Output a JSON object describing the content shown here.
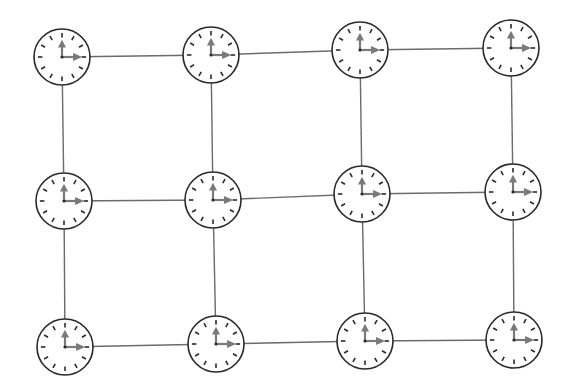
{
  "diagram": {
    "colors": {
      "background": "#ffffff",
      "line": "#6b6b6b",
      "clock_outline": "#2a2a2a",
      "tick": "#2a2a2a",
      "hand": "#7a7a7a"
    },
    "clock_radius": 28,
    "time_shown": "3:00",
    "rows": 3,
    "cols": 4,
    "clocks": [
      {
        "row": 0,
        "col": 0,
        "cx": 62,
        "cy": 57,
        "time": "3:00"
      },
      {
        "row": 0,
        "col": 1,
        "cx": 211,
        "cy": 55,
        "time": "3:00"
      },
      {
        "row": 0,
        "col": 2,
        "cx": 360,
        "cy": 50,
        "time": "3:00"
      },
      {
        "row": 0,
        "col": 3,
        "cx": 511,
        "cy": 48,
        "time": "3:00"
      },
      {
        "row": 1,
        "col": 0,
        "cx": 64,
        "cy": 201,
        "time": "3:00"
      },
      {
        "row": 1,
        "col": 1,
        "cx": 213,
        "cy": 200,
        "time": "3:00"
      },
      {
        "row": 1,
        "col": 2,
        "cx": 362,
        "cy": 194,
        "time": "3:00"
      },
      {
        "row": 1,
        "col": 3,
        "cx": 513,
        "cy": 192,
        "time": "3:00"
      },
      {
        "row": 2,
        "col": 0,
        "cx": 65,
        "cy": 347,
        "time": "3:00"
      },
      {
        "row": 2,
        "col": 1,
        "cx": 216,
        "cy": 344,
        "time": "3:00"
      },
      {
        "row": 2,
        "col": 2,
        "cx": 365,
        "cy": 341,
        "time": "3:00"
      },
      {
        "row": 2,
        "col": 3,
        "cx": 514,
        "cy": 340,
        "time": "3:00"
      }
    ]
  }
}
